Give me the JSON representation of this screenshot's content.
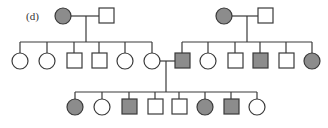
{
  "figure": {
    "label": "(d)",
    "type": "pedigree",
    "colors": {
      "affected_fill": "#8c8c8c",
      "unaffected_fill": "#ffffff",
      "stroke": "#3a3a3a",
      "line": "#3a3a3a"
    },
    "legend": {
      "circle": "female",
      "square": "male",
      "filled": "affected",
      "open": "unaffected"
    }
  },
  "generations": [
    {
      "id": "I",
      "individuals": [
        {
          "id": "I-1",
          "sex": "female",
          "affected": true
        },
        {
          "id": "I-2",
          "sex": "male",
          "affected": false
        },
        {
          "id": "I-3",
          "sex": "female",
          "affected": true
        },
        {
          "id": "I-4",
          "sex": "male",
          "affected": false
        }
      ]
    },
    {
      "id": "II",
      "individuals": [
        {
          "id": "II-1",
          "sex": "female",
          "affected": false,
          "parents": [
            "I-1",
            "I-2"
          ]
        },
        {
          "id": "II-2",
          "sex": "female",
          "affected": false,
          "parents": [
            "I-1",
            "I-2"
          ]
        },
        {
          "id": "II-3",
          "sex": "male",
          "affected": false,
          "parents": [
            "I-1",
            "I-2"
          ]
        },
        {
          "id": "II-4",
          "sex": "male",
          "affected": false,
          "parents": [
            "I-1",
            "I-2"
          ]
        },
        {
          "id": "II-5",
          "sex": "female",
          "affected": false,
          "parents": [
            "I-1",
            "I-2"
          ]
        },
        {
          "id": "II-6",
          "sex": "female",
          "affected": false,
          "parents": [
            "I-1",
            "I-2"
          ]
        },
        {
          "id": "II-7",
          "sex": "male",
          "affected": true,
          "parents": [
            "I-3",
            "I-4"
          ]
        },
        {
          "id": "II-8",
          "sex": "female",
          "affected": false,
          "parents": [
            "I-3",
            "I-4"
          ]
        },
        {
          "id": "II-9",
          "sex": "male",
          "affected": false,
          "parents": [
            "I-3",
            "I-4"
          ]
        },
        {
          "id": "II-10",
          "sex": "male",
          "affected": true,
          "parents": [
            "I-3",
            "I-4"
          ]
        },
        {
          "id": "II-11",
          "sex": "male",
          "affected": false,
          "parents": [
            "I-3",
            "I-4"
          ]
        },
        {
          "id": "II-12",
          "sex": "female",
          "affected": true,
          "parents": [
            "I-3",
            "I-4"
          ]
        }
      ]
    },
    {
      "id": "III",
      "individuals": [
        {
          "id": "III-1",
          "sex": "female",
          "affected": true,
          "parents": [
            "II-6",
            "II-7"
          ]
        },
        {
          "id": "III-2",
          "sex": "female",
          "affected": false,
          "parents": [
            "II-6",
            "II-7"
          ]
        },
        {
          "id": "III-3",
          "sex": "male",
          "affected": true,
          "parents": [
            "II-6",
            "II-7"
          ]
        },
        {
          "id": "III-4",
          "sex": "male",
          "affected": false,
          "parents": [
            "II-6",
            "II-7"
          ]
        },
        {
          "id": "III-5",
          "sex": "male",
          "affected": false,
          "parents": [
            "II-6",
            "II-7"
          ]
        },
        {
          "id": "III-6",
          "sex": "female",
          "affected": true,
          "parents": [
            "II-6",
            "II-7"
          ]
        },
        {
          "id": "III-7",
          "sex": "male",
          "affected": true,
          "parents": [
            "II-6",
            "II-7"
          ]
        },
        {
          "id": "III-8",
          "sex": "female",
          "affected": false,
          "parents": [
            "II-6",
            "II-7"
          ]
        }
      ]
    }
  ],
  "marriages": [
    {
      "partners": [
        "I-1",
        "I-2"
      ]
    },
    {
      "partners": [
        "I-3",
        "I-4"
      ]
    },
    {
      "partners": [
        "II-6",
        "II-7"
      ]
    }
  ]
}
